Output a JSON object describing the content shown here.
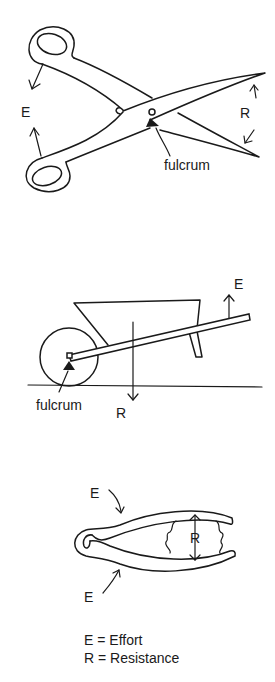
{
  "figures": [
    {
      "name": "scissors",
      "labels": {
        "effort": "E",
        "resistance": "R",
        "fulcrum": "fulcrum"
      }
    },
    {
      "name": "wheelbarrow",
      "labels": {
        "effort": "E",
        "resistance": "R",
        "fulcrum": "fulcrum"
      }
    },
    {
      "name": "tweezers",
      "labels": {
        "effort_top": "E",
        "effort_bottom": "E",
        "resistance": "R"
      }
    }
  ],
  "legend": {
    "effort": "E = Effort",
    "resistance": "R = Resistance"
  }
}
